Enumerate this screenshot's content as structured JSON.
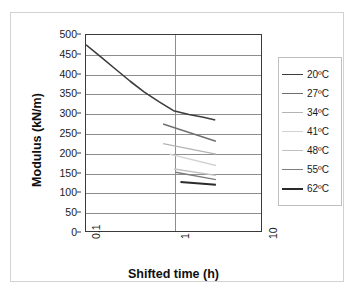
{
  "chart_data": {
    "type": "line",
    "title": "",
    "xlabel": "Shifted time (h)",
    "ylabel": "Modulus (kN/m)",
    "xscale": "log",
    "xlim": [
      0.1,
      10
    ],
    "ylim": [
      0,
      500
    ],
    "xticks": [
      "0.1",
      "1",
      "10"
    ],
    "yticks": [
      "0",
      "50",
      "100",
      "150",
      "200",
      "250",
      "300",
      "350",
      "400",
      "450",
      "500"
    ],
    "grid": "horizontal-and-vertical",
    "legend_position": "right",
    "series": [
      {
        "name": "20ºC",
        "color": "#3d3d3d",
        "width": 1.6,
        "points": [
          [
            0.1,
            475
          ],
          [
            0.15,
            443
          ],
          [
            0.22,
            412
          ],
          [
            0.32,
            382
          ],
          [
            0.46,
            355
          ],
          [
            0.68,
            330
          ],
          [
            1.0,
            307
          ],
          [
            1.5,
            297
          ],
          [
            2.2,
            290
          ],
          [
            3.0,
            283
          ]
        ]
      },
      {
        "name": "27ºC",
        "color": "#6f6f6f",
        "width": 1.4,
        "points": [
          [
            0.76,
            273
          ],
          [
            3.05,
            229
          ]
        ]
      },
      {
        "name": "34ºC",
        "color": "#b4b4b4",
        "width": 1.4,
        "points": [
          [
            0.76,
            223
          ],
          [
            3.05,
            196
          ]
        ]
      },
      {
        "name": "41ºC",
        "color": "#d2d2d2",
        "width": 1.4,
        "points": [
          [
            0.9,
            196
          ],
          [
            3.05,
            167
          ]
        ]
      },
      {
        "name": "48ºC",
        "color": "#c0c0c0",
        "width": 1.4,
        "points": [
          [
            1.02,
            158
          ],
          [
            3.05,
            142
          ]
        ]
      },
      {
        "name": "55ºC",
        "color": "#7d7d7d",
        "width": 1.4,
        "points": [
          [
            1.06,
            150
          ],
          [
            3.05,
            131
          ]
        ]
      },
      {
        "name": "62ºC",
        "color": "#2a2a2a",
        "width": 2.0,
        "points": [
          [
            1.2,
            125
          ],
          [
            3.05,
            118
          ]
        ]
      }
    ]
  },
  "legend": {
    "items": [
      {
        "label": "20ºC",
        "color": "#3d3d3d",
        "width": 1.6
      },
      {
        "label": "27ºC",
        "color": "#6f6f6f",
        "width": 1.4
      },
      {
        "label": "34ºC",
        "color": "#b4b4b4",
        "width": 1.3
      },
      {
        "label": "41ºC",
        "color": "#d2d2d2",
        "width": 1.3
      },
      {
        "label": "48ºC",
        "color": "#c0c0c0",
        "width": 1.3
      },
      {
        "label": "55ºC",
        "color": "#7d7d7d",
        "width": 1.4
      },
      {
        "label": "62ºC",
        "color": "#2a2a2a",
        "width": 2.0
      }
    ]
  }
}
